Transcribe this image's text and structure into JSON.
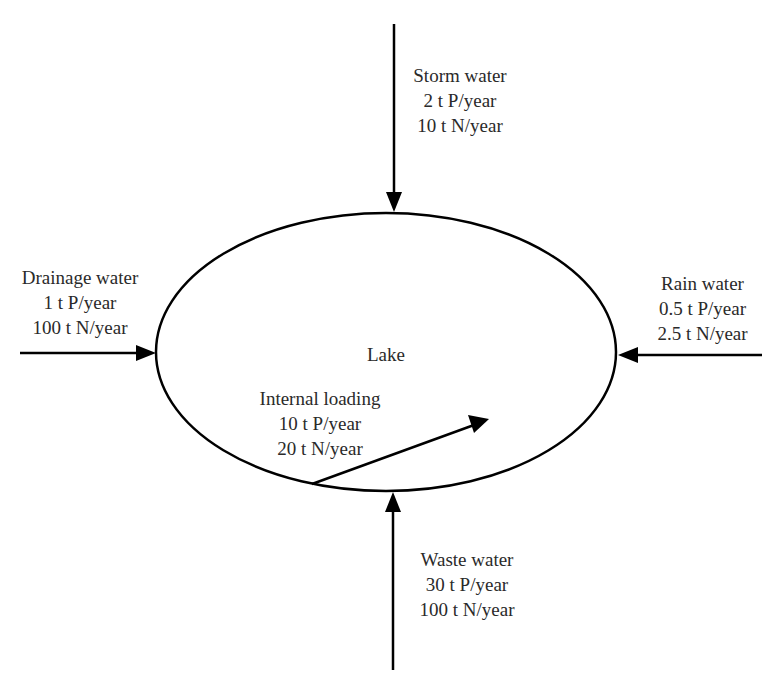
{
  "diagram": {
    "center": {
      "label": "Lake"
    },
    "flows": {
      "storm": {
        "title": "Storm water",
        "p": "2 t P/year",
        "n": "10 t N/year",
        "direction": "in-from-top"
      },
      "drainage": {
        "title": "Drainage water",
        "p": "1 t P/year",
        "n": "100 t N/year",
        "direction": "in-from-left"
      },
      "rain": {
        "title": "Rain water",
        "p": "0.5 t P/year",
        "n": "2.5 t N/year",
        "direction": "in-from-right"
      },
      "internal": {
        "title": "Internal loading",
        "p": "10 t P/year",
        "n": "20 t N/year",
        "direction": "internal"
      },
      "waste": {
        "title": "Waste water",
        "p": "30 t P/year",
        "n": "100 t N/year",
        "direction": "in-from-bottom"
      }
    },
    "colors": {
      "stroke": "#000000",
      "text": "#2a2a2a",
      "background": "#ffffff"
    }
  }
}
